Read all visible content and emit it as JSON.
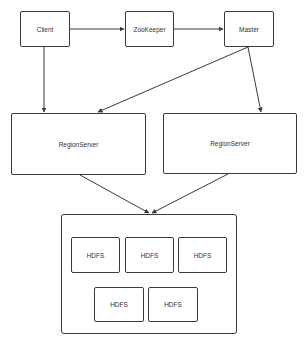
{
  "diagram": {
    "type": "architecture",
    "nodes": {
      "client": {
        "label": "Client"
      },
      "zookeeper": {
        "label": "ZooKeeper"
      },
      "master": {
        "label": "Master"
      },
      "regionserver_left": {
        "label": "RegionServer"
      },
      "regionserver_right": {
        "label": "RegionServer"
      },
      "hdfs_cluster": {
        "label": ""
      },
      "hdfs": [
        {
          "label": "HDFS"
        },
        {
          "label": "HDFS"
        },
        {
          "label": "HDFS"
        },
        {
          "label": "HDFS"
        },
        {
          "label": "HDFS"
        }
      ]
    },
    "edges": [
      {
        "from": "Client",
        "to": "ZooKeeper"
      },
      {
        "from": "ZooKeeper",
        "to": "Master"
      },
      {
        "from": "Client",
        "to": "RegionServer (left)"
      },
      {
        "from": "Master",
        "to": "RegionServer (left)"
      },
      {
        "from": "Master",
        "to": "RegionServer (right)"
      },
      {
        "from": "RegionServer (left)",
        "to": "HDFS cluster"
      },
      {
        "from": "RegionServer (right)",
        "to": "HDFS cluster"
      }
    ],
    "colors": {
      "stroke": "#3a3a3a",
      "text": "#333333",
      "background": "#ffffff"
    }
  }
}
